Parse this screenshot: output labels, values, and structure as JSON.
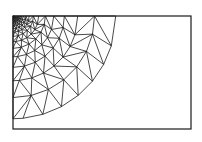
{
  "figure": {
    "type": "triangular-finite-element-mesh",
    "colors": {
      "background": "#ffffff",
      "edge": "#1a1a1a",
      "border": "#1a1a1a"
    },
    "domain": {
      "x0": 13,
      "y0": 16,
      "x1": 191,
      "y1": 129
    },
    "refinement_corner": "top-left",
    "grading": {
      "rings": 16,
      "inner_radius": 1.5,
      "growth": 1.26,
      "base_nodes_per_ring": 5
    },
    "edge_width": 0.8,
    "border_width": 1.2
  }
}
